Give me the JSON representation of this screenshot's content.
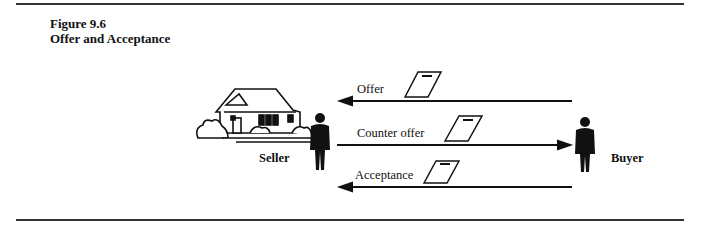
{
  "figure": {
    "number": "Figure 9.6",
    "title": "Offer and Acceptance"
  },
  "parties": {
    "seller": "Seller",
    "buyer": "Buyer"
  },
  "messages": [
    {
      "label": "Offer",
      "direction": "buyer-to-seller"
    },
    {
      "label": "Counter offer",
      "direction": "seller-to-buyer"
    },
    {
      "label": "Acceptance",
      "direction": "buyer-to-seller"
    }
  ]
}
